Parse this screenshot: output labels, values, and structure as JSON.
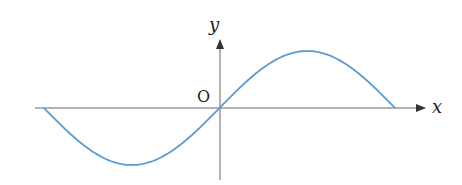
{
  "figure": {
    "type": "sine curve graph",
    "axis_labels": {
      "x": "x",
      "y": "y",
      "origin": "O"
    },
    "colors": {
      "curve": "#5b9bd5",
      "axis": "#555555",
      "text": "#231f20"
    },
    "curve": {
      "function": "y = sin x",
      "domain": "[-π, π]",
      "start_point": "(-π, 0)",
      "trough": "(-π/2, -1)",
      "origin": "(0, 0)",
      "peak": "(π/2, 1)",
      "end_point": "(π, 0)"
    }
  }
}
